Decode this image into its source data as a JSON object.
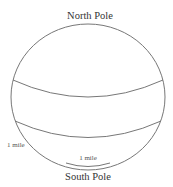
{
  "diagram": {
    "title_top": "North Pole",
    "title_bottom": "South Pole",
    "labels": {
      "left_arc": "1 mile",
      "bottom_cap": "1 mile"
    },
    "shapes": {
      "sphere": {
        "cx": 88,
        "cy": 97,
        "rx": 77,
        "ry": 73
      },
      "upper_band": "northern latitude line",
      "lower_band": "southern latitude line",
      "south_cap": "small circle near south pole"
    },
    "colors": {
      "stroke": "#777777",
      "text": "#333333",
      "background": "#ffffff"
    }
  }
}
